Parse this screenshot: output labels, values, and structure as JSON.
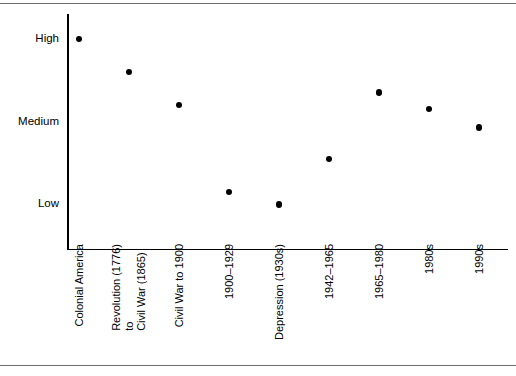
{
  "chart_data": {
    "type": "scatter",
    "title": "",
    "subtitle": "",
    "xlabel": "",
    "ylabel": "",
    "grid": false,
    "legend": null,
    "y_tick_labels": [
      "High",
      "Medium",
      "Low"
    ],
    "y_tick_values": [
      3,
      2,
      1
    ],
    "ylim": [
      0.45,
      3.3
    ],
    "categories": [
      "Colonial America",
      "Revolution (1776)\nto\nCivil War (1865)",
      "Civil War to 1900",
      "1900–1929",
      "Depression (1930s)",
      "1942–1965",
      "1965–1980",
      "1980s",
      "1990s"
    ],
    "category_lines": [
      [
        "Colonial America"
      ],
      [
        "Revolution (1776)",
        "to",
        "Civil War (1865)"
      ],
      [
        "Civil War to 1900"
      ],
      [
        "1900–1929"
      ],
      [
        "Depression (1930s)"
      ],
      [
        "1942–1965"
      ],
      [
        "1965–1980"
      ],
      [
        "1980s"
      ],
      [
        "1990s"
      ]
    ],
    "values": [
      3.0,
      2.6,
      2.2,
      1.15,
      1.0,
      1.55,
      2.35,
      2.15,
      1.93
    ],
    "value_labels": [
      "High",
      "High-Medium",
      "Medium",
      "Low",
      "Low",
      "Low-Medium",
      "Medium",
      "Medium",
      "Medium"
    ],
    "point_color": "#000000",
    "axis_color": "#000000",
    "frame_rule_color": "#6e6e6e",
    "background_color": "#ffffff"
  }
}
